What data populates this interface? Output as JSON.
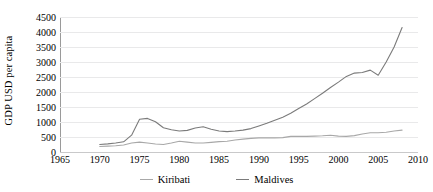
{
  "chart_data": {
    "type": "line",
    "title": "",
    "xlabel": "",
    "ylabel": "GDP USD per capita",
    "xlim": [
      1965,
      2010
    ],
    "ylim": [
      0,
      4500
    ],
    "ytick_step": 500,
    "xtick_step": 5,
    "grid": true,
    "legend_position": "bottom",
    "xticks": [
      1965,
      1970,
      1975,
      1980,
      1985,
      1990,
      1995,
      2000,
      2005,
      2010
    ],
    "yticks": [
      0,
      500,
      1000,
      1500,
      2000,
      2500,
      3000,
      3500,
      4000,
      4500
    ],
    "series": [
      {
        "name": "Kiribati",
        "color": "#a8a8a8",
        "x": [
          1970,
          1971,
          1972,
          1973,
          1974,
          1975,
          1976,
          1977,
          1978,
          1979,
          1980,
          1981,
          1982,
          1983,
          1984,
          1985,
          1986,
          1987,
          1988,
          1989,
          1990,
          1991,
          1992,
          1993,
          1994,
          1995,
          1996,
          1997,
          1998,
          1999,
          2000,
          2001,
          2002,
          2003,
          2004,
          2005,
          2006,
          2007,
          2008
        ],
        "values": [
          185,
          195,
          210,
          235,
          300,
          330,
          300,
          265,
          250,
          300,
          360,
          330,
          300,
          300,
          320,
          345,
          360,
          400,
          430,
          455,
          470,
          470,
          470,
          480,
          520,
          520,
          520,
          530,
          540,
          560,
          530,
          520,
          545,
          600,
          640,
          640,
          660,
          700,
          730
        ]
      },
      {
        "name": "Maldives",
        "color": "#7b7b7b",
        "x": [
          1970,
          1971,
          1972,
          1973,
          1974,
          1975,
          1976,
          1977,
          1978,
          1979,
          1980,
          1981,
          1982,
          1983,
          1984,
          1985,
          1986,
          1987,
          1988,
          1989,
          1990,
          1991,
          1992,
          1993,
          1994,
          1995,
          1996,
          1997,
          1998,
          1999,
          2000,
          2001,
          2002,
          2003,
          2004,
          2005,
          2006,
          2007,
          2008
        ],
        "values": [
          250,
          270,
          300,
          340,
          560,
          1090,
          1120,
          1010,
          810,
          740,
          700,
          720,
          800,
          840,
          760,
          700,
          680,
          700,
          730,
          780,
          870,
          960,
          1060,
          1160,
          1290,
          1450,
          1600,
          1780,
          1960,
          2150,
          2330,
          2520,
          2630,
          2650,
          2730,
          2560,
          3000,
          3500,
          4150
        ]
      }
    ]
  },
  "legend": {
    "entries": [
      {
        "label": "Kiribati"
      },
      {
        "label": "Maldives"
      }
    ]
  }
}
